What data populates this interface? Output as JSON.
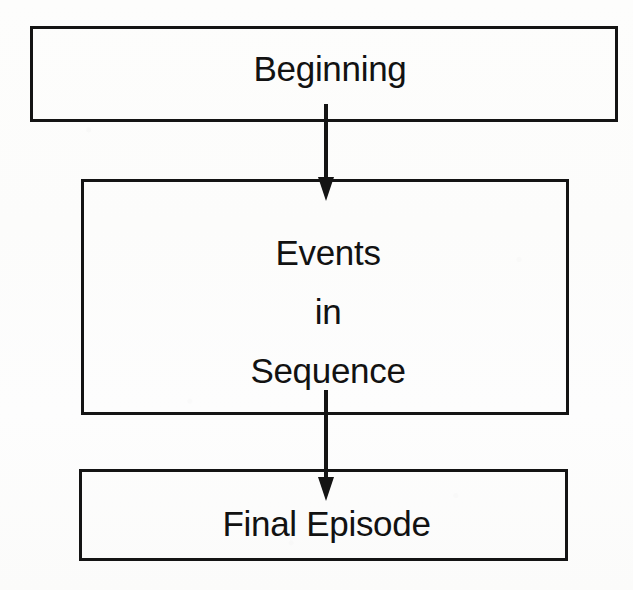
{
  "diagram": {
    "type": "vertical-flowchart",
    "orientation": "top-to-bottom",
    "background_color": "#fdfdfc",
    "stroke_color": "#141414",
    "text_color": "#121212",
    "nodes": [
      {
        "id": "beginning",
        "label": "Beginning",
        "shape": "rectangle",
        "x": 30,
        "y": 26,
        "width": 588,
        "height": 96
      },
      {
        "id": "events",
        "label_lines": [
          "Events",
          "in",
          "Sequence"
        ],
        "line1": "Events",
        "line2": "in",
        "line3": "Sequence",
        "shape": "rectangle",
        "x": 81,
        "y": 179,
        "width": 488,
        "height": 236
      },
      {
        "id": "final",
        "label": "Final Episode",
        "shape": "rectangle",
        "x": 79,
        "y": 469,
        "width": 489,
        "height": 92
      }
    ],
    "connectors": [
      {
        "id": "beginning-to-events",
        "from": "beginning",
        "to": "events",
        "style": "solid-arrow",
        "direction": "down",
        "arrowhead": "filled-triangle"
      },
      {
        "id": "events-to-final",
        "from": "events",
        "to": "final",
        "style": "solid-arrow",
        "direction": "down",
        "arrowhead": "filled-triangle"
      }
    ]
  }
}
